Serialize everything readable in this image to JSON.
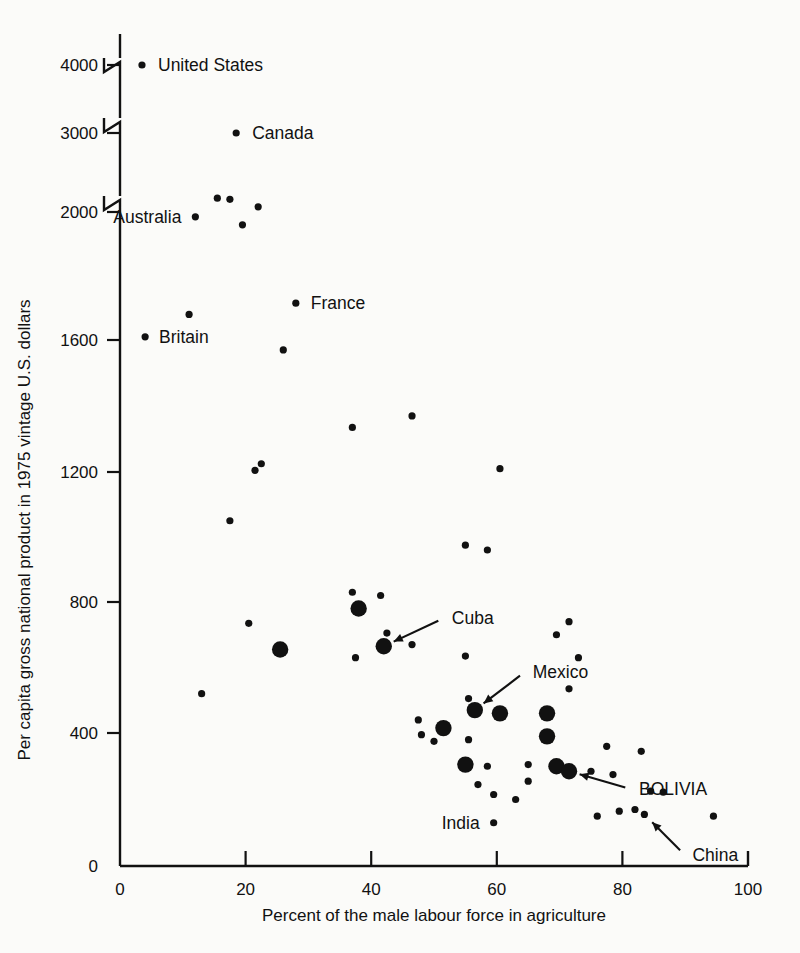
{
  "chart_data": {
    "type": "scatter",
    "title": "",
    "xlabel": "Percent of the male labour force in agriculture",
    "ylabel": "Per capita gross national product in 1975 vintage U.S. dollars",
    "xlim": [
      0,
      100
    ],
    "ylim": [
      0,
      4200
    ],
    "xticks": [
      "0",
      "20",
      "40",
      "60",
      "80",
      "100"
    ],
    "xtick_values": [
      0,
      20,
      40,
      60,
      80,
      100
    ],
    "yticks": [
      "0",
      "400",
      "800",
      "1200",
      "1600",
      "2000",
      "3000",
      "4000"
    ],
    "ytick_values": [
      0,
      400,
      800,
      1200,
      1600,
      2000,
      3000,
      4000
    ],
    "grid": false,
    "legend": "none",
    "axis_breaks": [
      {
        "between": [
          2000,
          3000
        ],
        "note": "axis-break-zigzag"
      },
      {
        "between": [
          3000,
          4000
        ],
        "note": "axis-break-zigzag"
      },
      {
        "above": 4000,
        "note": "axis-break-zigzag"
      }
    ],
    "marker_sizes": {
      "small": "small dot (ordinary country)",
      "large": "large dot (highlighted country)"
    },
    "annotations": [
      {
        "label": "United States",
        "x": 3.5,
        "y": 4000,
        "style": "dot-left-of-label"
      },
      {
        "label": "Canada",
        "x": 18.5,
        "y": 3000,
        "style": "dot-left-of-label"
      },
      {
        "label": "Australia",
        "x": 12.0,
        "y": 1985,
        "style": "dot-right-of-label"
      },
      {
        "label": "Britain",
        "x": 4.0,
        "y": 1610,
        "style": "dot-left-of-label"
      },
      {
        "label": "France",
        "x": 28.0,
        "y": 1715,
        "style": "dot-left-of-label"
      },
      {
        "label": "Cuba",
        "x": 42.0,
        "y": 665,
        "style": "arrow"
      },
      {
        "label": "Mexico",
        "x": 56.5,
        "y": 470,
        "style": "arrow"
      },
      {
        "label": "BOLIVIA",
        "x": 71.5,
        "y": 285,
        "style": "arrow"
      },
      {
        "label": "India",
        "x": 59.5,
        "y": 130,
        "style": "dot-right-of-label"
      },
      {
        "label": "China",
        "x": 83.5,
        "y": 155,
        "style": "arrow"
      }
    ],
    "points": [
      {
        "x": 3.5,
        "y": 4000,
        "size": "small"
      },
      {
        "x": 18.5,
        "y": 3000,
        "size": "small"
      },
      {
        "x": 15.5,
        "y": 2175,
        "size": "small"
      },
      {
        "x": 17.5,
        "y": 2160,
        "size": "small"
      },
      {
        "x": 22.0,
        "y": 2065,
        "size": "small"
      },
      {
        "x": 12.0,
        "y": 1985,
        "size": "small"
      },
      {
        "x": 19.5,
        "y": 1960,
        "size": "small"
      },
      {
        "x": 28.0,
        "y": 1715,
        "size": "small"
      },
      {
        "x": 11.0,
        "y": 1680,
        "size": "small"
      },
      {
        "x": 4.0,
        "y": 1610,
        "size": "small"
      },
      {
        "x": 26.0,
        "y": 1570,
        "size": "small"
      },
      {
        "x": 37.0,
        "y": 1335,
        "size": "small"
      },
      {
        "x": 46.5,
        "y": 1370,
        "size": "small"
      },
      {
        "x": 60.5,
        "y": 1210,
        "size": "small"
      },
      {
        "x": 22.5,
        "y": 1225,
        "size": "small"
      },
      {
        "x": 21.5,
        "y": 1205,
        "size": "small"
      },
      {
        "x": 17.5,
        "y": 1050,
        "size": "small"
      },
      {
        "x": 55.0,
        "y": 975,
        "size": "small"
      },
      {
        "x": 58.5,
        "y": 960,
        "size": "small"
      },
      {
        "x": 37.0,
        "y": 830,
        "size": "small"
      },
      {
        "x": 41.5,
        "y": 820,
        "size": "small"
      },
      {
        "x": 38.0,
        "y": 780,
        "size": "large"
      },
      {
        "x": 20.5,
        "y": 735,
        "size": "small"
      },
      {
        "x": 42.5,
        "y": 705,
        "size": "small"
      },
      {
        "x": 71.5,
        "y": 740,
        "size": "small"
      },
      {
        "x": 69.5,
        "y": 700,
        "size": "small"
      },
      {
        "x": 25.5,
        "y": 655,
        "size": "large"
      },
      {
        "x": 42.0,
        "y": 665,
        "size": "large"
      },
      {
        "x": 46.5,
        "y": 670,
        "size": "small"
      },
      {
        "x": 37.5,
        "y": 630,
        "size": "small"
      },
      {
        "x": 55.0,
        "y": 635,
        "size": "small"
      },
      {
        "x": 73.0,
        "y": 630,
        "size": "small"
      },
      {
        "x": 71.5,
        "y": 535,
        "size": "small"
      },
      {
        "x": 13.0,
        "y": 520,
        "size": "small"
      },
      {
        "x": 55.5,
        "y": 505,
        "size": "small"
      },
      {
        "x": 56.5,
        "y": 470,
        "size": "large"
      },
      {
        "x": 60.5,
        "y": 460,
        "size": "large"
      },
      {
        "x": 68.0,
        "y": 460,
        "size": "large"
      },
      {
        "x": 47.5,
        "y": 440,
        "size": "small"
      },
      {
        "x": 51.5,
        "y": 415,
        "size": "large"
      },
      {
        "x": 48.0,
        "y": 395,
        "size": "small"
      },
      {
        "x": 50.0,
        "y": 375,
        "size": "small"
      },
      {
        "x": 55.5,
        "y": 380,
        "size": "small"
      },
      {
        "x": 68.0,
        "y": 390,
        "size": "large"
      },
      {
        "x": 77.5,
        "y": 360,
        "size": "small"
      },
      {
        "x": 83.0,
        "y": 345,
        "size": "small"
      },
      {
        "x": 55.0,
        "y": 305,
        "size": "large"
      },
      {
        "x": 58.5,
        "y": 300,
        "size": "small"
      },
      {
        "x": 65.0,
        "y": 305,
        "size": "small"
      },
      {
        "x": 69.5,
        "y": 300,
        "size": "large"
      },
      {
        "x": 71.5,
        "y": 285,
        "size": "large"
      },
      {
        "x": 75.0,
        "y": 285,
        "size": "small"
      },
      {
        "x": 78.5,
        "y": 275,
        "size": "small"
      },
      {
        "x": 65.0,
        "y": 255,
        "size": "small"
      },
      {
        "x": 57.0,
        "y": 245,
        "size": "small"
      },
      {
        "x": 59.5,
        "y": 215,
        "size": "small"
      },
      {
        "x": 84.5,
        "y": 225,
        "size": "small"
      },
      {
        "x": 86.5,
        "y": 222,
        "size": "small"
      },
      {
        "x": 63.0,
        "y": 200,
        "size": "small"
      },
      {
        "x": 79.5,
        "y": 165,
        "size": "small"
      },
      {
        "x": 82.0,
        "y": 170,
        "size": "small"
      },
      {
        "x": 83.5,
        "y": 155,
        "size": "small"
      },
      {
        "x": 76.0,
        "y": 150,
        "size": "small"
      },
      {
        "x": 94.5,
        "y": 150,
        "size": "small"
      },
      {
        "x": 59.5,
        "y": 130,
        "size": "small"
      }
    ]
  }
}
